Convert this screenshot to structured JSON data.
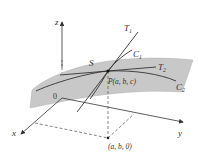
{
  "diagram": {
    "surface_label": "S",
    "point_label": "P(a, b, c)",
    "projection_label": "(a, b, 0)",
    "origin_label": "0",
    "axes": {
      "x": "x",
      "y": "y",
      "z": "z"
    },
    "curves": {
      "c1": "C",
      "c1_sub": "1",
      "c2": "C",
      "c2_sub": "2"
    },
    "tangents": {
      "t1": "T",
      "t1_sub": "1",
      "t2": "T",
      "t2_sub": "2"
    },
    "colors": {
      "surface": "#c8c8c8",
      "line": "#333333"
    }
  }
}
